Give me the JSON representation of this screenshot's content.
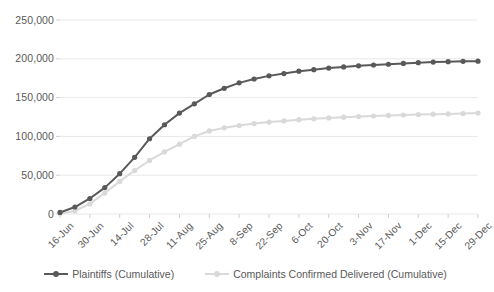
{
  "chart_data": {
    "type": "line",
    "title": "",
    "xlabel": "",
    "ylabel": "",
    "ylim": [
      0,
      250000
    ],
    "ytick_values": [
      0,
      50000,
      100000,
      150000,
      200000,
      250000
    ],
    "ytick_labels": [
      "0",
      "50,000",
      "100,000",
      "150,000",
      "200,000",
      "250,000"
    ],
    "grid": true,
    "legend_position": "bottom",
    "xtick_labels": [
      "16-Jun",
      "30-Jun",
      "14-Jul",
      "28-Jul",
      "11-Aug",
      "25-Aug",
      "8-Sep",
      "22-Sep",
      "6-Oct",
      "20-Oct",
      "3-Nov",
      "17-Nov",
      "1-Dec",
      "15-Dec",
      "29-Dec"
    ],
    "x": [
      "16-Jun",
      "23-Jun",
      "30-Jun",
      "7-Jul",
      "14-Jul",
      "21-Jul",
      "28-Jul",
      "4-Aug",
      "11-Aug",
      "18-Aug",
      "25-Aug",
      "1-Sep",
      "8-Sep",
      "15-Sep",
      "22-Sep",
      "29-Sep",
      "6-Oct",
      "13-Oct",
      "20-Oct",
      "27-Oct",
      "3-Nov",
      "10-Nov",
      "17-Nov",
      "24-Nov",
      "1-Dec",
      "8-Dec",
      "15-Dec",
      "22-Dec",
      "29-Dec"
    ],
    "series": [
      {
        "name": "Plaintiffs (Cumulative)",
        "color": "#595959",
        "values": [
          2000,
          9000,
          20000,
          34000,
          52000,
          73000,
          97000,
          115000,
          130000,
          142000,
          154000,
          162000,
          169000,
          174000,
          178000,
          181000,
          184000,
          186000,
          188000,
          189500,
          191000,
          192000,
          193000,
          194000,
          195000,
          195800,
          196300,
          196800,
          197000
        ]
      },
      {
        "name": "Complaints Confirmed Delivered (Cumulative)",
        "color": "#d9d9d9",
        "values": [
          500,
          4000,
          13000,
          27000,
          42000,
          56000,
          69000,
          80000,
          90000,
          100000,
          107000,
          111000,
          114000,
          116500,
          118500,
          120000,
          121500,
          122700,
          123800,
          124800,
          125600,
          126300,
          127000,
          127600,
          128100,
          128600,
          129000,
          129400,
          130000
        ]
      }
    ]
  },
  "legend": {
    "items": [
      {
        "label": "Plaintiffs (Cumulative)",
        "color": "#595959"
      },
      {
        "label": "Complaints Confirmed Delivered (Cumulative)",
        "color": "#d9d9d9"
      }
    ]
  },
  "colors": {
    "series_dark": "#595959",
    "series_light": "#d9d9d9",
    "gridline": "#e8e8e8",
    "text": "#595959",
    "background": "#ffffff"
  }
}
